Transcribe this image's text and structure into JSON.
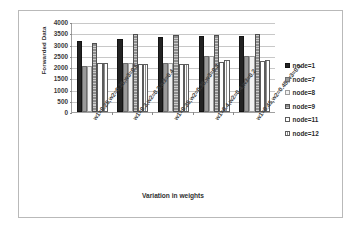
{
  "chart_data": {
    "type": "bar",
    "title": "",
    "xlabel": "Variation in weights",
    "ylabel": "Forwarded Data",
    "ylim": [
      0,
      4000
    ],
    "yticks": [
      4000,
      3500,
      3000,
      2500,
      2000,
      1500,
      1000,
      500,
      0
    ],
    "grid": true,
    "legend_position": "right",
    "categories": [
      "w1=0.25,w2=0.25,w3=0.5",
      "w1=0.3,w2=0.3,w3=0.4",
      "w1=0.35,w2=0.35,w3=0.3",
      "w1=0.4,w2=0.4,w3=0.2",
      "w1=0.45,w2=0.45,w3=0.1"
    ],
    "series": [
      {
        "name": "node=1",
        "color": "#232323",
        "values": [
          3150,
          3230,
          3330,
          3390,
          3390
        ]
      },
      {
        "name": "node=7",
        "color": "#9a9a9a",
        "values": [
          2050,
          2160,
          2170,
          2500,
          2500
        ]
      },
      {
        "name": "node=8",
        "color": "#f2f2f2",
        "values": [
          2050,
          2160,
          2170,
          2500,
          2500
        ]
      },
      {
        "name": "node=9",
        "color": "#8d8d8d",
        "values": [
          3050,
          3450,
          3440,
          3430,
          3450
        ]
      },
      {
        "name": "node=11",
        "color": "#ffffff",
        "values": [
          2170,
          2140,
          2130,
          2210,
          2250
        ]
      },
      {
        "name": "node=12",
        "color": "#ffffff",
        "values": [
          2170,
          2140,
          2130,
          2310,
          2330
        ]
      }
    ]
  },
  "legend": {
    "items": [
      {
        "label": "node=1"
      },
      {
        "label": "node=7"
      },
      {
        "label": "node=8"
      },
      {
        "label": "node=9"
      },
      {
        "label": "node=11"
      },
      {
        "label": "node=12"
      }
    ]
  }
}
